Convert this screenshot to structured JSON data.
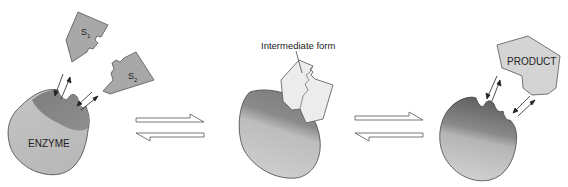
{
  "diagram": {
    "title_cutoff": "",
    "stages": [
      {
        "id": "substrates-and-enzyme",
        "enzyme_label": "ENZYME",
        "substrates": [
          {
            "label": "S",
            "subscript": "1"
          },
          {
            "label": "S",
            "subscript": "2"
          }
        ]
      },
      {
        "id": "intermediate",
        "callout": "Intermediate form"
      },
      {
        "id": "product-release",
        "product_label": "PRODUCT"
      }
    ],
    "equilibrium_arrows": [
      {
        "between": [
          "substrates-and-enzyme",
          "intermediate"
        ],
        "type": "reversible"
      },
      {
        "between": [
          "intermediate",
          "product-release"
        ],
        "type": "reversible"
      }
    ],
    "colors": {
      "substrate_fill": "#a8a8a8",
      "substrate_stroke": "#555555",
      "enzyme_light": "#c8c8c8",
      "enzyme_dark": "#6e6e6e",
      "intermediate_fill": "#ececec",
      "product_fill": "#d4d4d4",
      "outline": "#444444"
    }
  }
}
